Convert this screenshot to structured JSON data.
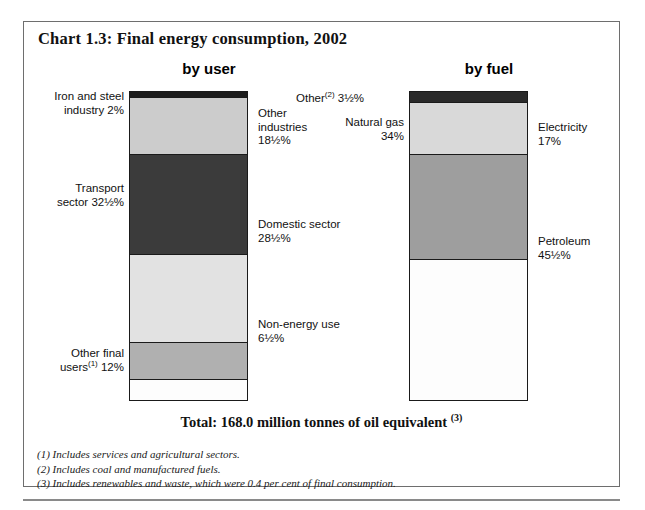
{
  "chart_frame": {
    "title": "Chart 1.3: Final energy consumption, 2002",
    "total_line": "Total: 168.0 million tonnes of oil equivalent",
    "total_footnote_marker": "(3)"
  },
  "columns": {
    "by_user_header": "by user",
    "by_fuel_header": "by fuel"
  },
  "labels": {
    "iron_steel": "Iron and steel\nindustry 2%",
    "transport": "Transport\nsector 32½%",
    "other_final_users_pre": "Other final\nusers",
    "other_final_users_marker": "(1)",
    "other_final_users_post": " 12%",
    "other_industries": "Other\nindustries\n18½%",
    "domestic": "Domestic sector\n28½%",
    "non_energy": "Non-energy use\n6½%",
    "other_fuel_pre": "Other",
    "other_fuel_marker": "(2)",
    "other_fuel_post": " 3½%",
    "natural_gas": "Natural gas\n34%",
    "electricity": "Electricity\n17%",
    "petroleum": "Petroleum\n45½%"
  },
  "footnotes": [
    "(1) Includes services and agricultural sectors.",
    "(2) Includes coal and manufactured fuels.",
    "(3) Includes renewables and waste, which were 0.4 per cent of final consumption."
  ],
  "chart_data": {
    "type": "bar",
    "subtype": "stacked-100-percent",
    "title": "Chart 1.3: Final energy consumption, 2002",
    "unit": "per cent of final energy consumption",
    "total": "168.0 million tonnes of oil equivalent",
    "xlabel": "",
    "ylabel": "",
    "ylim": [
      0,
      100
    ],
    "grid": false,
    "legend": "none (direct labels)",
    "categories": [
      "by user",
      "by fuel"
    ],
    "series": [
      {
        "category": "by user",
        "segments": [
          {
            "name": "Iron and steel industry",
            "value": 2,
            "label": "Iron and steel industry 2%",
            "color": "#1c1c1c"
          },
          {
            "name": "Other industries",
            "value": 18.5,
            "label": "Other industries 18½%",
            "color": "#cccccc"
          },
          {
            "name": "Transport sector",
            "value": 32.5,
            "label": "Transport sector 32½%",
            "color": "#3b3b3b"
          },
          {
            "name": "Domestic sector",
            "value": 28.5,
            "label": "Domestic sector 28½%",
            "color": "#e2e2e2"
          },
          {
            "name": "Other final users",
            "value": 12,
            "label": "Other final users(1) 12%",
            "color": "#b0b0b0"
          },
          {
            "name": "Non-energy use",
            "value": 6.5,
            "label": "Non-energy use 6½%",
            "color": "#fdfdfd"
          }
        ]
      },
      {
        "category": "by fuel",
        "segments": [
          {
            "name": "Other",
            "value": 3.5,
            "label": "Other(2) 3½%",
            "color": "#2a2a2a"
          },
          {
            "name": "Electricity",
            "value": 17,
            "label": "Electricity 17%",
            "color": "#d9d9d9"
          },
          {
            "name": "Natural gas",
            "value": 34,
            "label": "Natural gas 34%",
            "color": "#9e9e9e"
          },
          {
            "name": "Petroleum",
            "value": 45.5,
            "label": "Petroleum 45½%",
            "color": "#fdfdfd"
          }
        ]
      }
    ]
  }
}
